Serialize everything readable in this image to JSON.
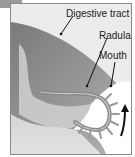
{
  "figure": {
    "labels": {
      "digestive_tract": "Digestive tract",
      "radula": "Radula",
      "mouth": "Mouth"
    },
    "arrow_direction": "up",
    "colors": {
      "background": "#ececec",
      "tissue": "#8c8c8c",
      "radula_teeth": "#a9a9a9",
      "white_space": "#ffffff"
    }
  }
}
